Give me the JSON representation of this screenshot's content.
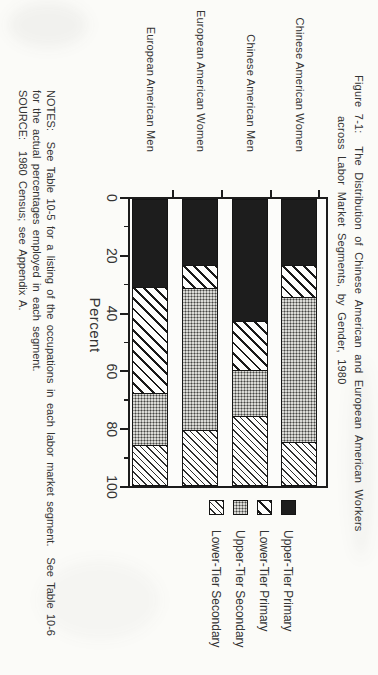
{
  "page": {
    "title_line1": "Figure 7-1:  The Distribution of Chinese American and European American Workers",
    "title_line2": "across Labor Market Segments, by Gender, 1980",
    "notes_line1": "NOTES:  See Table 10-5 for a listing of the occupations in each labor market segment.  See Table 10-6",
    "notes_line2": "for the actual percentages employed in each segment.",
    "notes_line3": "SOURCE:  1980 Census; see Appendix A.",
    "ink_color": "#2a2a2a",
    "paper_color": "#fbfbf8"
  },
  "chart_data": {
    "type": "bar",
    "variant": "horizontal-stacked-100percent",
    "title": "Figure 7-1: The Distribution of Chinese American and European American Workers across Labor Market Segments, by Gender, 1980",
    "xlabel": "Percent",
    "xlim": [
      0,
      100
    ],
    "xticks": [
      "0",
      "20",
      "40",
      "60",
      "80",
      "100"
    ],
    "minor_ticks": [
      10,
      30,
      50,
      70,
      90
    ],
    "grid": false,
    "legend_position": "right-of-plot",
    "categories": [
      "Chinese American Women",
      "Chinese American Men",
      "European American Women",
      "European American Men"
    ],
    "series": [
      {
        "name": "Upper-Tier Primary",
        "pattern": "solid-black",
        "values": [
          23,
          43,
          23,
          31
        ]
      },
      {
        "name": "Lower-Tier Primary",
        "pattern": "diagonal-hatch-coarse",
        "values": [
          11,
          17,
          8,
          37
        ]
      },
      {
        "name": "Upper-Tier Secondary",
        "pattern": "dot-screen",
        "values": [
          51,
          16,
          50,
          18
        ]
      },
      {
        "name": "Lower-Tier Secondary",
        "pattern": "diagonal-hatch-fine",
        "values": [
          15,
          24,
          19,
          14
        ]
      }
    ]
  }
}
